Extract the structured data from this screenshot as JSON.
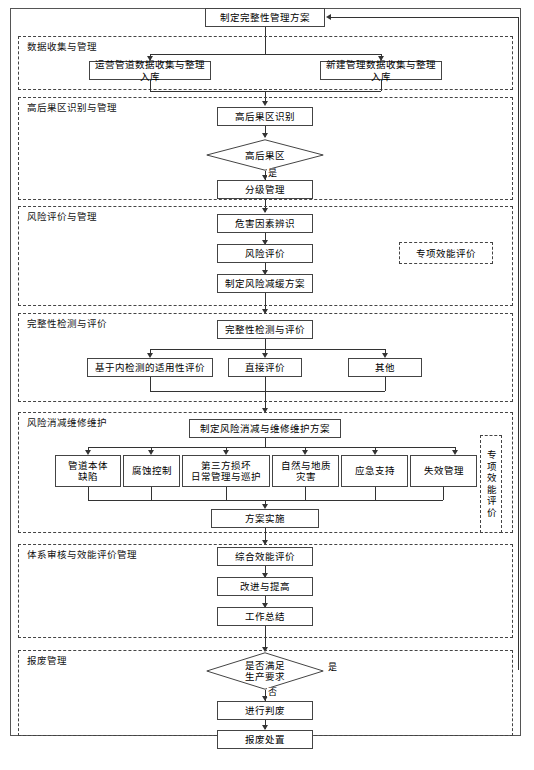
{
  "diagram": {
    "start_node": "制定完整性管理方案",
    "lanes": [
      {
        "id": "data",
        "label": "数据收集与管理",
        "nodes": [
          "运营管道数据收集与整理入库",
          "新建管理数据收集与整理入库"
        ]
      },
      {
        "id": "hca",
        "label": "高后果区识别与管理",
        "nodes": [
          "高后果区识别",
          "高后果区",
          "分级管理"
        ],
        "decision_yes": "是"
      },
      {
        "id": "risk",
        "label": "风险评价与管理",
        "nodes": [
          "危害因素辨识",
          "风险评价",
          "制定风险减缓方案"
        ],
        "note": "专项效能评价"
      },
      {
        "id": "integrity",
        "label": "完整性检测与评价",
        "nodes": [
          "完整性检测与评价",
          "基于内检测的适用性评价",
          "直接评价",
          "其他"
        ]
      },
      {
        "id": "mitigation",
        "label": "风险消减维修维护",
        "nodes": [
          "制定风险消减与维修维护方案",
          "管道本体\n缺陷",
          "腐蚀控制",
          "第三方损坏\n日常管理与巡护",
          "自然与地质\n灾害",
          "应急支持",
          "失效管理",
          "方案实施"
        ],
        "note": "专项效能评价"
      },
      {
        "id": "audit",
        "label": "体系审核与效能评价管理",
        "nodes": [
          "综合效能评价",
          "改进与提高",
          "工作总结"
        ]
      },
      {
        "id": "scrap",
        "label": "报废管理",
        "nodes": [
          "是否满足\n生产要求",
          "进行判废",
          "报废处置"
        ],
        "decision_yes": "是",
        "decision_no": "否"
      }
    ],
    "colors": {
      "node_border": "#444444",
      "lane_border": "#444444",
      "frame_border": "#555555",
      "line": "#333333",
      "background": "#ffffff",
      "text": "#000000"
    }
  }
}
